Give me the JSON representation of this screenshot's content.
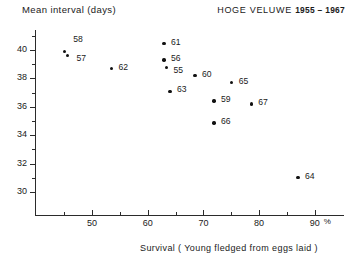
{
  "chart_data": {
    "type": "scatter",
    "title_place": "HOGE VELUWE",
    "title_years": "1955 – 1967",
    "xlabel": "Survival ( Young fledged from eggs laid )",
    "ylabel": "Mean interval  (days)",
    "xlim": [
      42,
      91
    ],
    "ylim": [
      29,
      41.3
    ],
    "xticks": [
      50,
      60,
      70,
      80,
      90
    ],
    "xtick_labels": [
      "50",
      "60",
      "70",
      "80",
      "90"
    ],
    "x_unit_suffix": "%",
    "xminor_ticks": [
      45,
      55,
      65,
      75,
      85
    ],
    "yticks": [
      30,
      32,
      34,
      36,
      38,
      40
    ],
    "ytick_labels": [
      "30",
      "32",
      "34",
      "36",
      "38",
      "40"
    ],
    "yminor_ticks": [
      31,
      33,
      35,
      37,
      39,
      41
    ],
    "grid": false,
    "legend": false,
    "point_label_field": "year",
    "points": [
      {
        "label": "58",
        "x": 45.0,
        "y": 39.9,
        "lx": 9,
        "ly": -13
      },
      {
        "label": "57",
        "x": 45.6,
        "y": 39.6,
        "lx": 9,
        "ly": 1
      },
      {
        "label": "62",
        "x": 53.5,
        "y": 38.7,
        "lx": 7,
        "ly": -3
      },
      {
        "label": "61",
        "x": 62.9,
        "y": 40.45,
        "lx": 7,
        "ly": -3
      },
      {
        "label": "56",
        "x": 62.9,
        "y": 39.3,
        "lx": 7,
        "ly": -3
      },
      {
        "label": "55",
        "x": 63.4,
        "y": 38.75,
        "lx": 7,
        "ly": 1
      },
      {
        "label": "60",
        "x": 68.5,
        "y": 38.2,
        "lx": 7,
        "ly": -3
      },
      {
        "label": "63",
        "x": 64.0,
        "y": 37.1,
        "lx": 7,
        "ly": -3
      },
      {
        "label": "65",
        "x": 75.1,
        "y": 37.7,
        "lx": 7,
        "ly": -3
      },
      {
        "label": "59",
        "x": 71.9,
        "y": 36.4,
        "lx": 7,
        "ly": -3
      },
      {
        "label": "67",
        "x": 78.6,
        "y": 36.2,
        "lx": 7,
        "ly": -3
      },
      {
        "label": "66",
        "x": 71.9,
        "y": 34.85,
        "lx": 7,
        "ly": -3
      },
      {
        "label": "64",
        "x": 87.0,
        "y": 31.0,
        "lx": 7,
        "ly": -3
      }
    ]
  },
  "geometry": {
    "plot_left": 35,
    "plot_right": 344,
    "plot_top": 30,
    "plot_bottom": 215,
    "x_at_50": 92,
    "px_per_x": 5.57,
    "y_at_40": 50,
    "px_per_y": 14.2
  }
}
